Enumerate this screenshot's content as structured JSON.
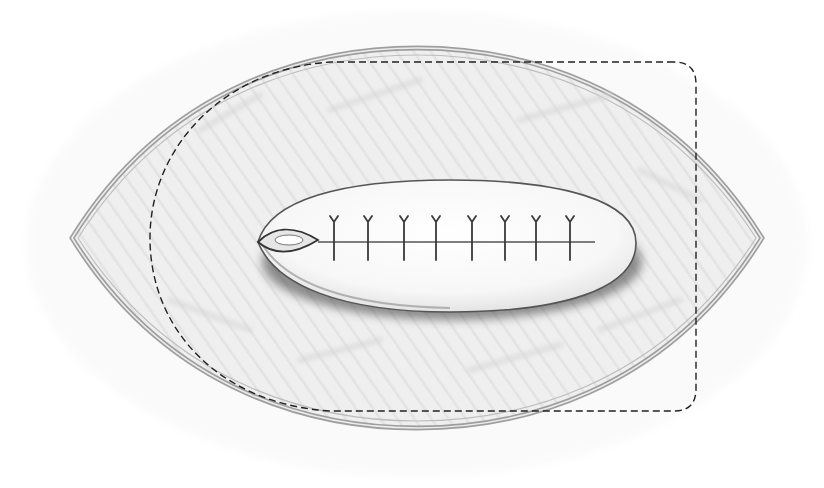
{
  "illustration": {
    "subject": "surgical-flap-closure-sketch",
    "colors": {
      "background": "#ffffff",
      "skin_fill": "#f1f1f1",
      "skin_shade": "#dcdcdc",
      "outline": "#8a8a8a",
      "flap_fill": "#fbfbfb",
      "shadow": "#4a4a4a",
      "dashed": "#222222",
      "suture": "#3a3a3a"
    },
    "outer_ellipse": {
      "left_tip": [
        72,
        238
      ],
      "right_tip": [
        762,
        238
      ],
      "top_y": 48,
      "bottom_y": 428
    },
    "flap_outline": {
      "x": 150,
      "y": 62,
      "right": 696,
      "bottom": 411,
      "corner_radius": 22
    },
    "inner_island": {
      "cx": 445,
      "cy": 243,
      "rx": 190,
      "ry": 70
    },
    "suture_count": 8,
    "suture_x": [
      334,
      368,
      404,
      436,
      472,
      505,
      536,
      570
    ],
    "suture_line_y": 242
  }
}
